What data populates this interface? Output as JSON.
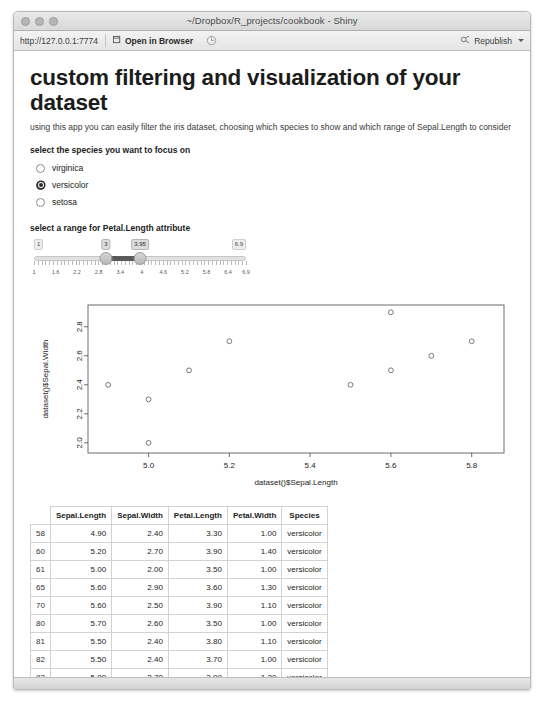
{
  "window": {
    "title": "~/Dropbox/R_projects/cookbook - Shiny",
    "traffic_lights": [
      "close",
      "minimize",
      "maximize"
    ]
  },
  "toolbar": {
    "url": "http://127.0.0.1:7774",
    "open_in_browser_label": "Open in Browser",
    "open_in_browser_icon": "external-window-icon",
    "reload_icon": "reload-icon",
    "republish_label": "Republish",
    "republish_icon": "republish-icon",
    "republish_caret_icon": "caret-down-icon"
  },
  "app": {
    "title": "custom filtering and visualization of your dataset",
    "subtitle": "using this app you can easily filter the iris dataset, choosing which species to show and which range of Sepal.Length to consider"
  },
  "species_input": {
    "label": "select the species you want to focus on",
    "options": [
      {
        "label": "virginica",
        "checked": false
      },
      {
        "label": "versicolor",
        "checked": true
      },
      {
        "label": "setosa",
        "checked": false
      }
    ]
  },
  "range_input": {
    "label": "select a range for Petal.Length attribute",
    "min_label": "1",
    "max_label": "6.9",
    "value_low": "3",
    "value_high": "3.95",
    "min": 1,
    "max": 6.9,
    "low": 3,
    "high": 3.95,
    "tick_labels": [
      "1",
      "1.6",
      "2.2",
      "2.8",
      "3.4",
      "4",
      "4.6",
      "5.2",
      "5.8",
      "6.4",
      "6.9"
    ],
    "tick_values": [
      1,
      1.6,
      2.2,
      2.8,
      3.4,
      4,
      4.6,
      5.2,
      5.8,
      6.4,
      6.9
    ]
  },
  "chart_data": {
    "type": "scatter",
    "title": "",
    "xlabel": "dataset()$Sepal.Length",
    "ylabel": "dataset()$Sepal.Width",
    "xlim": [
      4.85,
      5.88
    ],
    "ylim": [
      1.93,
      2.95
    ],
    "xticks": [
      5.0,
      5.2,
      5.4,
      5.6,
      5.8
    ],
    "xticklabels": [
      "5.0",
      "5.2",
      "5.4",
      "5.6",
      "5.8"
    ],
    "yticks": [
      2.0,
      2.2,
      2.4,
      2.6,
      2.8
    ],
    "yticklabels": [
      "2.0",
      "2.2",
      "2.4",
      "2.6",
      "2.8"
    ],
    "grid": false,
    "legend": null,
    "marker": "open-circle",
    "points": [
      {
        "x": 4.9,
        "y": 2.4
      },
      {
        "x": 5.0,
        "y": 2.0
      },
      {
        "x": 5.0,
        "y": 2.3
      },
      {
        "x": 5.1,
        "y": 2.5
      },
      {
        "x": 5.2,
        "y": 2.7
      },
      {
        "x": 5.5,
        "y": 2.4
      },
      {
        "x": 5.6,
        "y": 2.9
      },
      {
        "x": 5.6,
        "y": 2.5
      },
      {
        "x": 5.7,
        "y": 2.6
      },
      {
        "x": 5.8,
        "y": 2.7
      }
    ]
  },
  "table": {
    "columns": [
      "",
      "Sepal.Length",
      "Sepal.Width",
      "Petal.Length",
      "Petal.Width",
      "Species"
    ],
    "rows": [
      {
        "idx": "58",
        "sepal_length": "4.90",
        "sepal_width": "2.40",
        "petal_length": "3.30",
        "petal_width": "1.00",
        "species": "versicolor"
      },
      {
        "idx": "60",
        "sepal_length": "5.20",
        "sepal_width": "2.70",
        "petal_length": "3.90",
        "petal_width": "1.40",
        "species": "versicolor"
      },
      {
        "idx": "61",
        "sepal_length": "5.00",
        "sepal_width": "2.00",
        "petal_length": "3.50",
        "petal_width": "1.00",
        "species": "versicolor"
      },
      {
        "idx": "65",
        "sepal_length": "5.60",
        "sepal_width": "2.90",
        "petal_length": "3.60",
        "petal_width": "1.30",
        "species": "versicolor"
      },
      {
        "idx": "70",
        "sepal_length": "5.60",
        "sepal_width": "2.50",
        "petal_length": "3.90",
        "petal_width": "1.10",
        "species": "versicolor"
      },
      {
        "idx": "80",
        "sepal_length": "5.70",
        "sepal_width": "2.60",
        "petal_length": "3.50",
        "petal_width": "1.00",
        "species": "versicolor"
      },
      {
        "idx": "81",
        "sepal_length": "5.50",
        "sepal_width": "2.40",
        "petal_length": "3.80",
        "petal_width": "1.10",
        "species": "versicolor"
      },
      {
        "idx": "82",
        "sepal_length": "5.50",
        "sepal_width": "2.40",
        "petal_length": "3.70",
        "petal_width": "1.00",
        "species": "versicolor"
      },
      {
        "idx": "83",
        "sepal_length": "5.80",
        "sepal_width": "2.70",
        "petal_length": "3.90",
        "petal_width": "1.20",
        "species": "versicolor"
      },
      {
        "idx": "94",
        "sepal_length": "5.00",
        "sepal_width": "2.30",
        "petal_length": "3.30",
        "petal_width": "1.00",
        "species": "versicolor"
      },
      {
        "idx": "99",
        "sepal_length": "5.10",
        "sepal_width": "2.50",
        "petal_length": "3.00",
        "petal_width": "1.10",
        "species": "versicolor"
      }
    ]
  },
  "colors": {
    "accent": "#5a5a5a",
    "text": "#1c1c1c",
    "border": "#d2d2d2"
  }
}
